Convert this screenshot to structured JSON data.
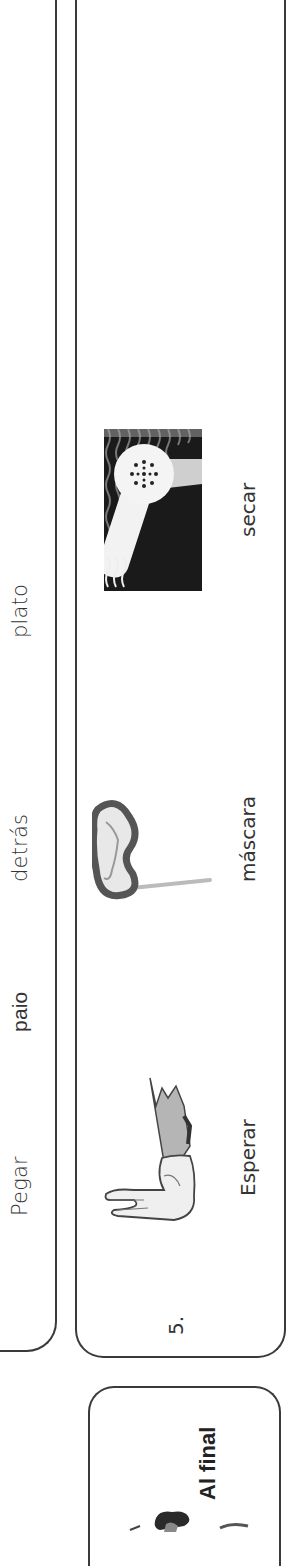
{
  "word_bank": {
    "words": [
      "plato",
      "detrás",
      "paio",
      "Pegar"
    ]
  },
  "card": {
    "number": "5.",
    "items": [
      {
        "label": "secar",
        "icon": "hair-dryer-icon"
      },
      {
        "label": "máscara",
        "icon": "mask-icon"
      },
      {
        "label": "Esperar",
        "icon": "hand-wait-icon"
      }
    ]
  },
  "final": {
    "title": "Al final",
    "icon": "person-illustration"
  },
  "colors": {
    "border": "#3a3a3a",
    "text": "#333333",
    "background": "#ffffff"
  }
}
